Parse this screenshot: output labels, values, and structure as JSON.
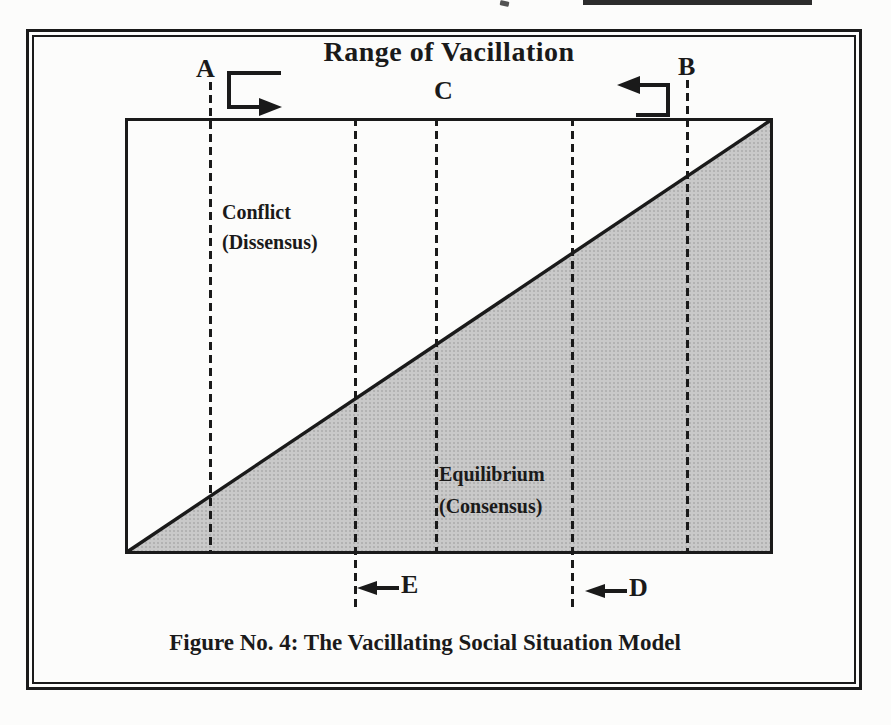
{
  "colors": {
    "ink": "#1a1a1a",
    "shade": "#c9c9c9",
    "page": "#fcfcfb"
  },
  "figure": {
    "title": "Range of Vacillation",
    "caption": "Figure No. 4: The Vacillating Social Situation Model",
    "markers": {
      "A": "A",
      "B": "B",
      "C": "C",
      "D": "D",
      "E": "E"
    },
    "regions": {
      "conflict": {
        "name": "Conflict",
        "qualifier": "(Dissensus)"
      },
      "equilibrium": {
        "name": "Equilibrium",
        "qualifier": "(Consensus)"
      }
    },
    "icons": {
      "marker_a": "u-turn-right-arrow",
      "marker_b": "u-turn-left-arrow",
      "marker_d": "left-arrow",
      "marker_e": "left-arrow"
    }
  }
}
